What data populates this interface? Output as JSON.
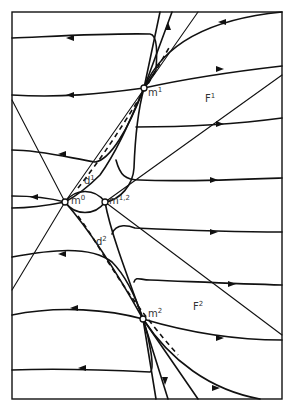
{
  "diagram": {
    "type": "phase-portrait",
    "frame": {
      "x": 12,
      "y": 12,
      "width": 270,
      "height": 387
    },
    "stroke_color": "#111111",
    "background": "#ffffff",
    "points": [
      {
        "id": "m1",
        "base": "m",
        "sup": "1",
        "x": 144,
        "y": 88
      },
      {
        "id": "m0",
        "base": "m",
        "sup": "0",
        "x": 65,
        "y": 202
      },
      {
        "id": "m12",
        "base": "m",
        "sup": "1,2",
        "x": 105,
        "y": 202
      },
      {
        "id": "m2",
        "base": "m",
        "sup": "2",
        "x": 143,
        "y": 319
      }
    ],
    "regions": [
      {
        "id": "F1",
        "base": "F",
        "sup": "1",
        "x": 205,
        "y": 94
      },
      {
        "id": "F2",
        "base": "F",
        "sup": "2",
        "x": 193,
        "y": 302
      }
    ],
    "separatrices": [
      {
        "id": "d1",
        "base": "d",
        "sup": "1",
        "x": 84,
        "y": 176
      },
      {
        "id": "d2",
        "base": "d",
        "sup": "2",
        "x": 96,
        "y": 237
      }
    ]
  }
}
